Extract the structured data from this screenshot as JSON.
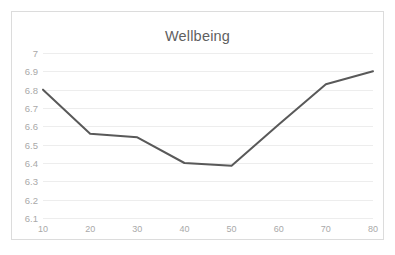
{
  "chart_data": {
    "type": "line",
    "title": "Wellbeing",
    "xlabel": "",
    "ylabel": "",
    "x": [
      10,
      20,
      30,
      40,
      50,
      60,
      70,
      80
    ],
    "xtick_labels": [
      "10",
      "20",
      "30",
      "40",
      "50",
      "60",
      "70",
      "80"
    ],
    "ytick_labels": [
      "7",
      "6.9",
      "6.8",
      "6.7",
      "6.6",
      "6.5",
      "6.4",
      "6.3",
      "6.2",
      "6.1"
    ],
    "ytick_values": [
      7,
      6.9,
      6.8,
      6.7,
      6.6,
      6.5,
      6.4,
      6.3,
      6.2,
      6.1
    ],
    "series": [
      {
        "name": "Wellbeing",
        "values": [
          6.8,
          6.56,
          6.54,
          6.4,
          6.385,
          6.61,
          6.83,
          6.9
        ]
      }
    ],
    "xlim": [
      10,
      80
    ],
    "ylim": [
      6.1,
      7
    ],
    "grid": true,
    "grid_axis": "y",
    "legend": false,
    "markers": false,
    "line_color": "#595959",
    "grid_color": "#ededed",
    "tick_label_color": "#a9a9a9",
    "title_color": "#5f5f5f",
    "border_color": "#dcdcdc",
    "background_color": "#ffffff"
  }
}
